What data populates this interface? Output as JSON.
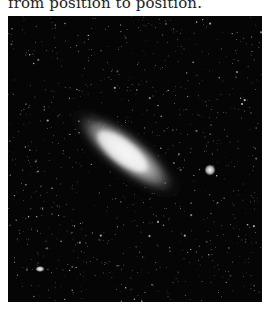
{
  "document": {
    "body_text_fragment": "from position to position.",
    "figure": {
      "subject": "spiral galaxy photograph (Andromeda-like) with two satellite galaxies on a star field",
      "background_color": "#050505",
      "galaxy_color": "#f0f0f0"
    }
  }
}
